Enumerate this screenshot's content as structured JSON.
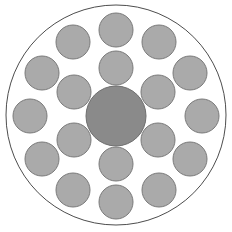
{
  "figure": {
    "name": "circular-bundle-cross-section",
    "background_color": "#ffffff",
    "canvas": {
      "width": 232,
      "height": 232
    }
  },
  "chart_data": {
    "type": "scatter",
    "title": "",
    "subtitle": "",
    "xlabel": "",
    "ylabel": "",
    "xlim": [
      0,
      232
    ],
    "ylim": [
      0,
      232
    ],
    "grid": false,
    "legend": null,
    "annotations": [],
    "tick_labels": {
      "x": [],
      "y": []
    },
    "series": [
      {
        "name": "boundary",
        "shape": "circle-outline",
        "fill": "none",
        "stroke": "#4d4d4d",
        "stroke_width": 1,
        "points": [
          {
            "cx": 116,
            "cy": 115,
            "r": 110
          }
        ]
      },
      {
        "name": "core",
        "shape": "circle",
        "fill": "#8a8a8a",
        "stroke": "#6e6e6e",
        "stroke_width": 1,
        "count": 1,
        "radius": 30,
        "points": [
          {
            "cx": 116,
            "cy": 116,
            "r": 30
          }
        ]
      },
      {
        "name": "inner-ring",
        "shape": "circle",
        "fill": "#aaaaaa",
        "stroke": "#7a7a7a",
        "stroke_width": 1,
        "count": 6,
        "radius": 17,
        "ring_radius": 48,
        "points": [
          {
            "cx": 116,
            "cy": 68,
            "r": 17
          },
          {
            "cx": 158,
            "cy": 92,
            "r": 17
          },
          {
            "cx": 158,
            "cy": 140,
            "r": 17
          },
          {
            "cx": 116,
            "cy": 164,
            "r": 17
          },
          {
            "cx": 74,
            "cy": 140,
            "r": 17
          },
          {
            "cx": 74,
            "cy": 92,
            "r": 17
          }
        ]
      },
      {
        "name": "outer-ring",
        "shape": "circle",
        "fill": "#aaaaaa",
        "stroke": "#7a7a7a",
        "stroke_width": 1,
        "count": 12,
        "radius": 17,
        "ring_radius": 86,
        "points": [
          {
            "cx": 116,
            "cy": 30,
            "r": 17
          },
          {
            "cx": 159,
            "cy": 42,
            "r": 17
          },
          {
            "cx": 190,
            "cy": 73,
            "r": 17
          },
          {
            "cx": 202,
            "cy": 116,
            "r": 17
          },
          {
            "cx": 190,
            "cy": 159,
            "r": 17
          },
          {
            "cx": 159,
            "cy": 190,
            "r": 17
          },
          {
            "cx": 116,
            "cy": 202,
            "r": 17
          },
          {
            "cx": 73,
            "cy": 190,
            "r": 17
          },
          {
            "cx": 42,
            "cy": 159,
            "r": 17
          },
          {
            "cx": 30,
            "cy": 116,
            "r": 17
          },
          {
            "cx": 42,
            "cy": 73,
            "r": 17
          },
          {
            "cx": 73,
            "cy": 42,
            "r": 17
          }
        ]
      }
    ],
    "totals": {
      "core_count": 1,
      "satellite_count": 18,
      "total_circles": 19
    }
  }
}
